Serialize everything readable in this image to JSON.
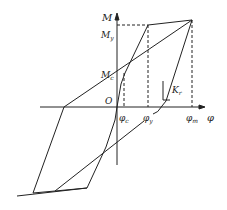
{
  "diagram": {
    "type": "moment-curvature hysteresis model",
    "axes": {
      "y_label": "M",
      "x_label": "φ",
      "origin_label": "O"
    },
    "y_ticks": [
      {
        "main": "M",
        "sub": "y"
      },
      {
        "main": "M",
        "sub": "c"
      }
    ],
    "x_ticks": [
      {
        "main": "φ",
        "sub": "c"
      },
      {
        "main": "φ",
        "sub": "y"
      },
      {
        "main": "φ",
        "sub": "m"
      }
    ],
    "stiffness_label": {
      "main": "K",
      "sub": "r"
    },
    "colors": {
      "line": "#222222",
      "background": "#ffffff"
    }
  }
}
